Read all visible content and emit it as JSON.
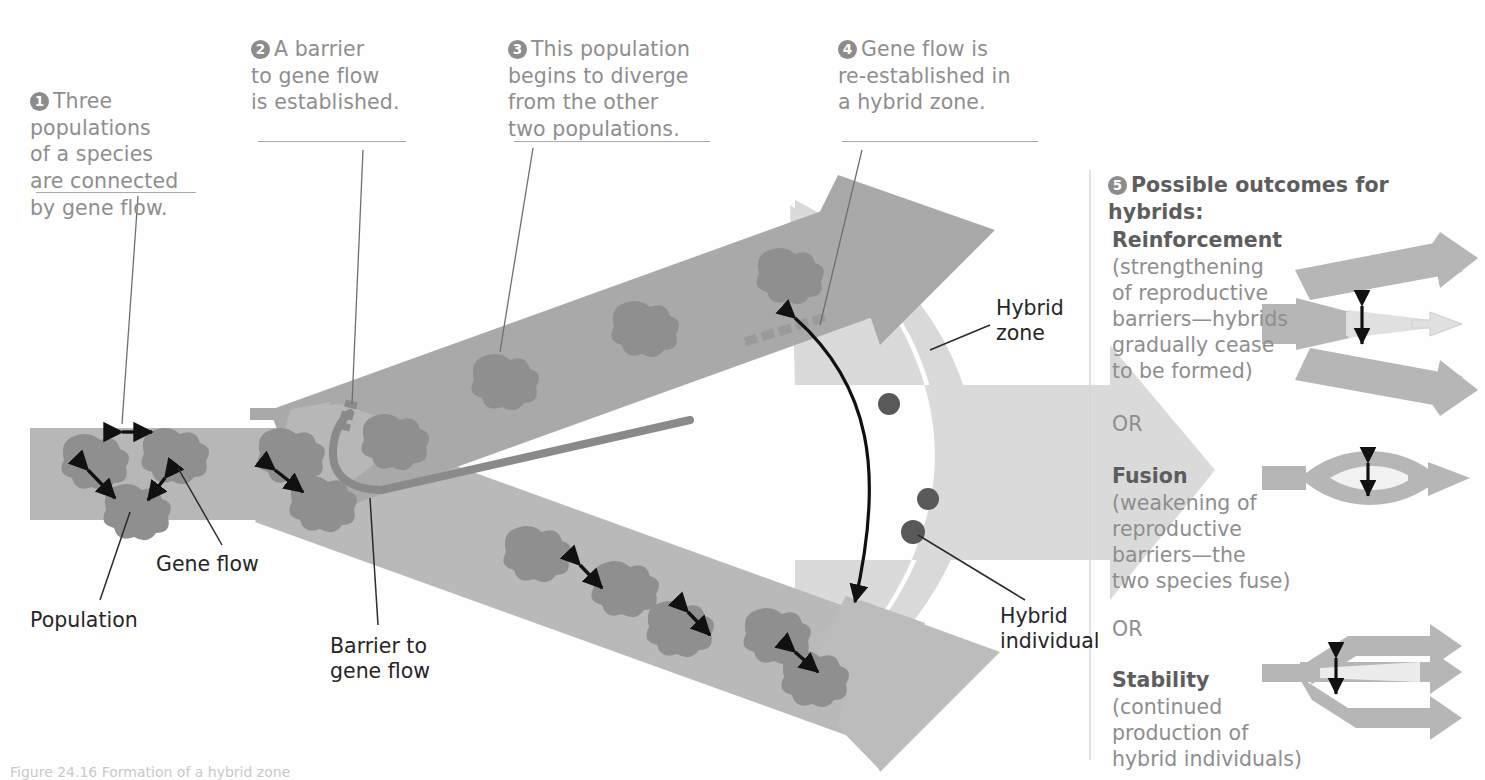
{
  "figure": {
    "caption": "Figure 24.16 Formation of a hybrid zone",
    "colors": {
      "band_light": "#b9b9b9",
      "band_mid": "#a8a8a8",
      "hybrid_zone": "#d8d8d8",
      "population_blob": "#8f8f8f",
      "hybrid_dot": "#595959",
      "barrier": "#8a8a8a",
      "callout_text": "#8e8e8e",
      "badge_fill": "#8c8c8c",
      "pointer_text": "#262626"
    }
  },
  "callouts": [
    {
      "num": "1",
      "text": "Three\npopulations\nof a species\nare connected\nby gene flow."
    },
    {
      "num": "2",
      "text": "A barrier\nto gene flow\nis established."
    },
    {
      "num": "3",
      "text": "This population\nbegins to diverge\nfrom the other\ntwo populations."
    },
    {
      "num": "4",
      "text": "Gene flow is\nre-established in\na hybrid zone."
    }
  ],
  "pointer_labels": [
    {
      "name": "population",
      "text": "Population"
    },
    {
      "name": "gene-flow",
      "text": "Gene flow"
    },
    {
      "name": "barrier-to-gene-flow",
      "text": "Barrier to\ngene flow"
    },
    {
      "name": "hybrid-zone",
      "text": "Hybrid\nzone"
    },
    {
      "name": "hybrid-individual",
      "text": "Hybrid\nindividual"
    }
  ],
  "right_panel": {
    "num": "5",
    "title": "Possible outcomes for hybrids:",
    "or_label": "OR",
    "outcomes": [
      {
        "name": "reinforcement",
        "heading": "Reinforcement",
        "body": "(strengthening\nof reproductive\nbarriers—hybrids\ngradually cease\nto be formed)",
        "icon": "diverging-arrows-icon"
      },
      {
        "name": "fusion",
        "heading": "Fusion",
        "body": "(weakening of\nreproductive\nbarriers—the\ntwo species fuse)",
        "icon": "merging-lens-arrow-icon"
      },
      {
        "name": "stability",
        "heading": "Stability",
        "body": "(continued\nproduction of\nhybrid individuals)",
        "icon": "three-parallel-arrows-icon"
      }
    ]
  }
}
